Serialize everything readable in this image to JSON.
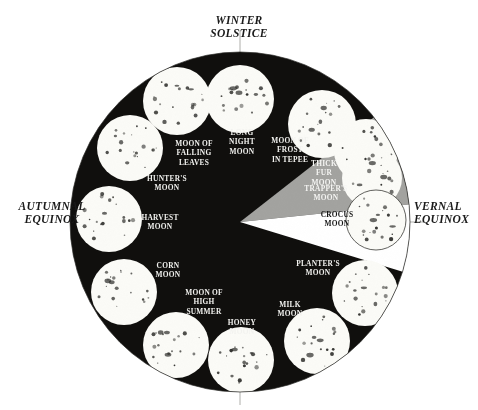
{
  "figure": {
    "center": {
      "x": 240,
      "y": 222
    },
    "radius": 170,
    "colors": {
      "disc_dark": "#100f0d",
      "wedge_gray": "#a3a3a0",
      "wedge_white": "#ffffff",
      "moon_white": "#fbfbf7",
      "crater": "#2b2b28",
      "background": "#ffffff",
      "axis_line": "#9a9a96",
      "label_light": "#f2f2ef",
      "label_dark": "#141414"
    }
  },
  "axes": {
    "winter": {
      "label": "WINTER\nSOLSTICE",
      "position": "top"
    },
    "autumnal": {
      "label": "AUTUMNAL\nEQUINOX",
      "position": "left"
    },
    "vernal": {
      "label": "VERNAL\nEQUINOX",
      "position": "right"
    }
  },
  "chart_data": {
    "type": "pie",
    "legend": "none",
    "grid": false,
    "categories": [
      "LONG NIGHT MOON",
      "MOON OF FROST IN TEPEE",
      "THICK FUR MOON",
      "TRAPPER'S MOON",
      "CROCUS MOON",
      "PLANTER'S MOON",
      "MILK MOON",
      "HONEY MOON",
      "MOON OF HIGH SUMMER",
      "CORN MOON",
      "HARVEST MOON",
      "HUNTER'S MOON",
      "MOON OF FALLING LEAVES"
    ],
    "values": [
      1,
      1,
      1,
      1,
      1,
      1,
      1,
      1,
      1,
      1,
      1,
      1,
      1
    ],
    "annotations": [
      "WINTER SOLSTICE",
      "AUTUMNAL EQUINOX",
      "VERNAL EQUINOX"
    ]
  },
  "moons": [
    {
      "name": "LONG NIGHT MOON",
      "label": "LONG\nNIGHT\nMOON",
      "disc": {
        "cx": 240,
        "cy": 99,
        "r": 34
      },
      "label_pos": {
        "x": 242,
        "y": 142
      },
      "tone": "on-dark"
    },
    {
      "name": "MOON OF FROST IN TEPEE",
      "label": "MOON OF\nFROST\nIN TEPEE",
      "disc": {
        "cx": 322,
        "cy": 124,
        "r": 34
      },
      "label_pos": {
        "x": 290,
        "y": 150
      },
      "tone": "on-dark"
    },
    {
      "name": "THICK FUR MOON",
      "label": "THICK\nFUR\nMOON",
      "disc": {
        "cx": 366,
        "cy": 151,
        "r": 32
      },
      "label_pos": {
        "x": 324,
        "y": 173
      },
      "tone": "on-gray"
    },
    {
      "name": "TRAPPER'S MOON",
      "label": "TRAPPER'S\nMOON",
      "disc": {
        "cx": 372,
        "cy": 178,
        "r": 30
      },
      "label_pos": {
        "x": 326,
        "y": 193
      },
      "tone": "on-gray"
    },
    {
      "name": "CROCUS MOON",
      "label": "CROCUS\nMOON",
      "disc": {
        "cx": 376,
        "cy": 220,
        "r": 30
      },
      "label_pos": {
        "x": 337,
        "y": 219
      },
      "tone": "on-light"
    },
    {
      "name": "PLANTER'S MOON",
      "label": "PLANTER'S\nMOON",
      "disc": {
        "cx": 365,
        "cy": 293,
        "r": 33
      },
      "label_pos": {
        "x": 318,
        "y": 268
      },
      "tone": "on-dark"
    },
    {
      "name": "MILK MOON",
      "label": "MILK\nMOON",
      "disc": {
        "cx": 317,
        "cy": 341,
        "r": 33
      },
      "label_pos": {
        "x": 290,
        "y": 309
      },
      "tone": "on-dark"
    },
    {
      "name": "HONEY MOON",
      "label": "HONEY\nMOON",
      "disc": {
        "cx": 241,
        "cy": 360,
        "r": 33
      },
      "label_pos": {
        "x": 242,
        "y": 327
      },
      "tone": "on-dark"
    },
    {
      "name": "MOON OF HIGH SUMMER",
      "label": "MOON OF\nHIGH\nSUMMER",
      "disc": {
        "cx": 176,
        "cy": 345,
        "r": 33
      },
      "label_pos": {
        "x": 204,
        "y": 302
      },
      "tone": "on-dark"
    },
    {
      "name": "CORN MOON",
      "label": "CORN\nMOON",
      "disc": {
        "cx": 124,
        "cy": 292,
        "r": 33
      },
      "label_pos": {
        "x": 168,
        "y": 270
      },
      "tone": "on-dark"
    },
    {
      "name": "HARVEST MOON",
      "label": "HARVEST\nMOON",
      "disc": {
        "cx": 109,
        "cy": 219,
        "r": 33
      },
      "label_pos": {
        "x": 160,
        "y": 222
      },
      "tone": "on-dark"
    },
    {
      "name": "HUNTER'S MOON",
      "label": "HUNTER'S\nMOON",
      "disc": {
        "cx": 130,
        "cy": 148,
        "r": 33
      },
      "label_pos": {
        "x": 167,
        "y": 183
      },
      "tone": "on-dark"
    },
    {
      "name": "MOON OF FALLING LEAVES",
      "label": "MOON OF\nFALLING\nLEAVES",
      "disc": {
        "cx": 177,
        "cy": 101,
        "r": 34
      },
      "label_pos": {
        "x": 194,
        "y": 153
      },
      "tone": "on-dark"
    }
  ],
  "wedges": [
    {
      "name": "gray-wedge",
      "start_deg": -38,
      "end_deg": -6,
      "fill": "#a3a3a0"
    },
    {
      "name": "white-wedge",
      "start_deg": -6,
      "end_deg": 17,
      "fill": "#ffffff"
    }
  ]
}
